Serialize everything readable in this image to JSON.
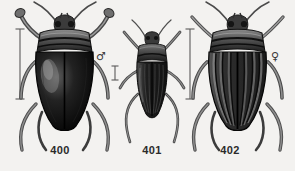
{
  "plate": {
    "background_color": "#f3f2f0",
    "ink_color": "#1a1a1a",
    "width": 295,
    "height": 171,
    "description": "Engraved plate of three diving beetles (Dytiscidae), dorsal view"
  },
  "figures": [
    {
      "id": "fig-400",
      "caption": "400",
      "sex_symbol": "♂",
      "sex_name": "male",
      "elytra": "smooth",
      "scale_bar": {
        "name": "scale-bar-400",
        "height_px": 72
      },
      "body_fill": "#141414",
      "pronotum_fill": "#6e6e6e",
      "highlight": "#8a8a8a"
    },
    {
      "id": "fig-401",
      "caption": "401",
      "sex_symbol": "",
      "sex_name": "",
      "elytra": "striate",
      "scale_bar": {
        "name": "scale-bar-401",
        "height_px": 16
      },
      "body_fill": "#242424",
      "pronotum_fill": "#555555",
      "highlight": "#7d7d7d"
    },
    {
      "id": "fig-402",
      "caption": "402",
      "sex_symbol": "♀",
      "sex_name": "female",
      "elytra": "sulcate",
      "scale_bar": {
        "name": "scale-bar-402",
        "height_px": 72
      },
      "body_fill": "#2e2e2e",
      "pronotum_fill": "#6a6a6a",
      "highlight": "#9a9a9a"
    }
  ]
}
